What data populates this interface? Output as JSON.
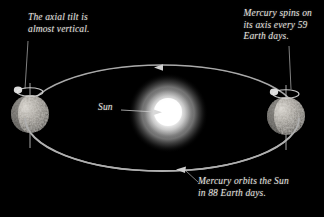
{
  "figure": {
    "background_color": "#000000",
    "text_color": "#e8e6e0",
    "width": 324,
    "height": 217
  },
  "captions": {
    "axial_tilt": "The axial tilt is\nalmost vertical.",
    "spin": "Mercury spins on\nits axis every 59\nEarth days.",
    "orbit": "Mercury orbits the Sun\nin 88 Earth days.",
    "sun": "Sun"
  },
  "bodies": {
    "sun": {
      "label": "Sun",
      "cx": 168,
      "cy": 113,
      "radius": 26,
      "color": "#ffffff",
      "glow_color": "#d8d8d8"
    },
    "mercury_left": {
      "label": "Mercury",
      "cx": 30,
      "cy": 114,
      "radius": 19,
      "color": "#8d8d8d"
    },
    "mercury_right": {
      "label": "Mercury",
      "cx": 286,
      "cy": 116,
      "radius": 19,
      "color": "#8d8d8d"
    }
  },
  "orbit": {
    "label": "orbit-ellipse",
    "cx": 162,
    "cy": 118,
    "rx": 137,
    "ry": 53,
    "stroke_color": "#b6b6b6",
    "direction_arrows": [
      {
        "name": "orbit-arrow-top",
        "x": 160,
        "y": 67,
        "points": "left"
      },
      {
        "name": "orbit-arrow-bottom",
        "x": 183,
        "y": 170,
        "points": "left"
      }
    ]
  },
  "axes": {
    "left_axis": {
      "x": 30,
      "y_top": 84,
      "y_bottom": 146,
      "note": "rotation axis, near vertical"
    },
    "right_axis": {
      "x": 286,
      "y_top": 86,
      "y_bottom": 148,
      "note": "rotation axis, near vertical"
    }
  },
  "leader_lines": {
    "tilt": {
      "x1": 28,
      "y1": 42,
      "x2": 25,
      "y2": 88
    },
    "spin": {
      "x1": 289,
      "y1": 47,
      "x2": 291,
      "y2": 88
    },
    "sun": {
      "x1": 123,
      "y1": 110,
      "x2": 160,
      "y2": 112
    },
    "orbit": {
      "x1": 196,
      "y1": 181,
      "x2": 184,
      "y2": 171
    }
  }
}
